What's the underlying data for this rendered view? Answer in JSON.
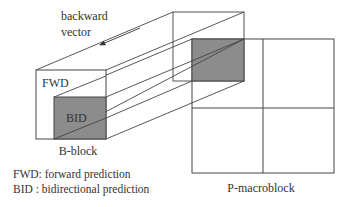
{
  "labels": {
    "backward_line1": "backward",
    "backward_line2": "vector",
    "fwd": "FWD",
    "bid": "BID",
    "b_block": "B-block",
    "p_macroblock": "P-macroblock"
  },
  "legend": {
    "line1": "FWD: forward prediction",
    "line2": "BID : bidirectional prediction"
  },
  "colors": {
    "stroke": "#444444",
    "gray_fill": "#8c8c8c",
    "text": "#333333"
  }
}
